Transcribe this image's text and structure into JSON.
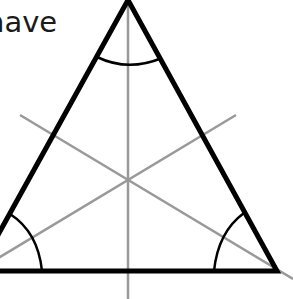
{
  "caption": {
    "text": "have"
  },
  "diagram": {
    "type": "equilateral-triangle-with-bisectors",
    "stroke_color": "#000000",
    "bisector_color": "#999999",
    "vertices": {
      "apex": [
        128,
        0
      ],
      "bottom_left": [
        -22,
        271
      ],
      "bottom_right": [
        277,
        271
      ]
    },
    "centroid": [
      128,
      181
    ]
  }
}
